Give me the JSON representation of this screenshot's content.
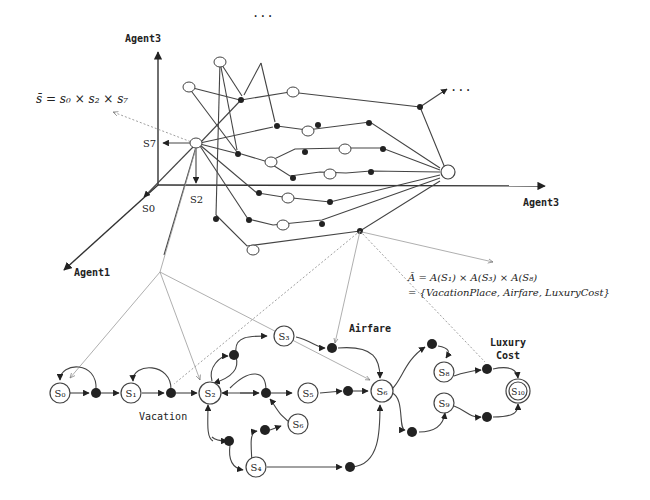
{
  "figure": {
    "top": {
      "axes": {
        "vertical_label": "Agent3",
        "horizontal_label": "Agent3",
        "diagonal_label": "Agent1"
      },
      "axis_markers": {
        "s7": "S7",
        "s2": "S2",
        "s0": "S0"
      },
      "formula": "s̄ = s₀ × s₂ × s₇",
      "ellipsis_top": "···",
      "ellipsis_right": "···"
    },
    "action_formula": {
      "line1": "Ā = A(S₁) × A(S₃) × A(S₈)",
      "line2": "= {VacationPlace, Airfare, LuxuryCost}"
    },
    "petri_net": {
      "places": [
        {
          "id": "S0",
          "label": "S₀"
        },
        {
          "id": "S1",
          "label": "S₁"
        },
        {
          "id": "S2",
          "label": "S₂"
        },
        {
          "id": "S3",
          "label": "S₃"
        },
        {
          "id": "S4",
          "label": "S₄"
        },
        {
          "id": "S5",
          "label": "S₅"
        },
        {
          "id": "S6",
          "label": "S₆"
        },
        {
          "id": "S7",
          "label": "S₇"
        },
        {
          "id": "S8",
          "label": "S₈"
        },
        {
          "id": "S9",
          "label": "S₉"
        },
        {
          "id": "S10",
          "label": "S₁₀"
        }
      ],
      "annotations": {
        "vacation_1": "Vacation",
        "vacation_2": "Place",
        "airfare": "Airfare",
        "luxury_1": "Luxury",
        "luxury_2": "Cost"
      }
    }
  }
}
